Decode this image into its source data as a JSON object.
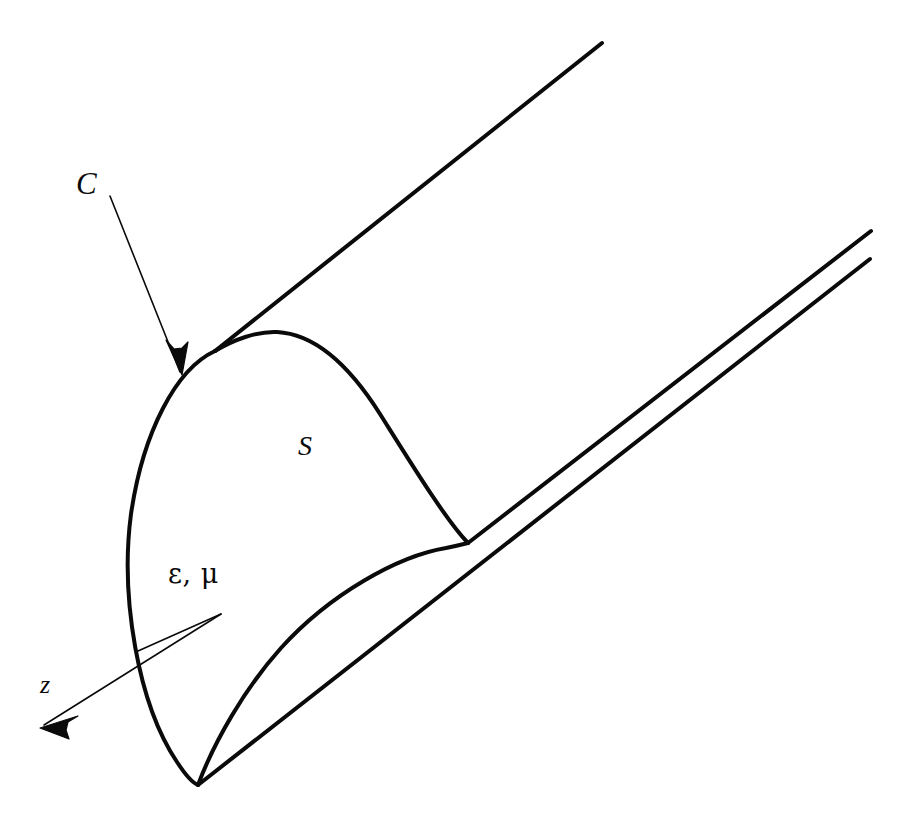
{
  "figure": {
    "kind": "waveguide-cross-section-diagram",
    "background_color": "#ffffff",
    "stroke_color": "#0a0a0a"
  },
  "labels": {
    "contour": "C",
    "surface": "S",
    "medium": "ε, μ",
    "axis": "z"
  },
  "annotations": {
    "contour_leader": {
      "label": "C",
      "description": "thin arrow from label C to the boundary curve",
      "arrowhead": "solid"
    },
    "medium_leader": {
      "label": "ε, μ",
      "description": "thin line from the medium label into the guide interior",
      "arrowhead": "none"
    },
    "axis_arrow": {
      "label": "z",
      "description": "thin arrow pointing down-left along the propagation axis",
      "arrowhead": "solid"
    }
  },
  "geometry": {
    "cross_section_outer": "M 215 351 C 176 369 143 432 131 514 C 120 597 138 704 177 762 C 186 776 193 783 198 785",
    "cross_section_top": "M 215 351 C 233 340 257 331 277 332 C 316 334 351 368 380 414 C 414 468 446 520 468 543",
    "cross_section_inner": "M 198 785 C 214 742 245 688 281 648 C 330 594 398 556 446 548 C 456 546 464 544 468 543",
    "tube_top_edge": "M 215 351 L 602 43",
    "tube_right_upper_edge": "M 468 543 L 871 231",
    "tube_right_lower_edge": "M 198 785 L 870 259",
    "contour_arrow_line": "M 110 196 L 180 372",
    "contour_arrow_tip": [
      182,
      375
    ],
    "medium_leader_line": "M 138 651 L 221 614",
    "axis_arrow_line": "M 221 614 L 44 725",
    "axis_arrow_tip": [
      40,
      728
    ],
    "stroke_width_thick": 4.0,
    "stroke_width_thin": 1.6
  }
}
